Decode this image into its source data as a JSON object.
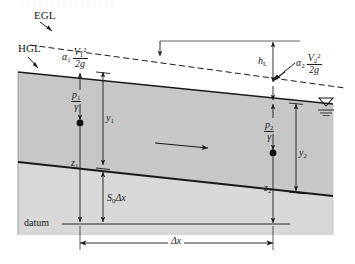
{
  "figure": {
    "type": "engineering-schematic",
    "width": 355,
    "height": 264,
    "colors": {
      "line": "#1a1a1a",
      "water_fill": "#c9c9c9",
      "bed_fill": "#d6d6d6",
      "background": "#ffffff"
    }
  },
  "labels": {
    "egl": "EGL",
    "hgl": "HGL",
    "datum": "datum",
    "head_loss": "h",
    "head_loss_sub": "L",
    "alpha1": "α",
    "alpha1_sub": "1",
    "alpha2": "α",
    "alpha2_sub": "2",
    "velocity_head_1_num_v": "V",
    "velocity_head_1_num_sub": "1",
    "velocity_head_1_num_sup": "2",
    "velocity_head_1_den": "2g",
    "velocity_head_2_num_v": "V",
    "velocity_head_2_num_sub": "2",
    "velocity_head_2_num_sup": "2",
    "velocity_head_2_den": "2g",
    "pressure_head_1_num": "p",
    "pressure_head_1_num_sub": "1",
    "pressure_head_1_den": "γ",
    "pressure_head_2_num": "p",
    "pressure_head_2_num_sub": "2",
    "pressure_head_2_den": "γ",
    "depth_1": "y",
    "depth_1_sub": "1",
    "depth_2": "y",
    "depth_2_sub": "2",
    "elevation_1": "z",
    "elevation_1_sub": "1",
    "elevation_2": "z",
    "elevation_2_sub": "2",
    "bed_drop": "S",
    "bed_drop_sub": "0",
    "bed_drop_tail": "Δx",
    "reach_length": "Δx"
  },
  "icons": {
    "free_surface": "water-surface-icon",
    "flow_arrow": "flow-direction-arrow-icon"
  }
}
